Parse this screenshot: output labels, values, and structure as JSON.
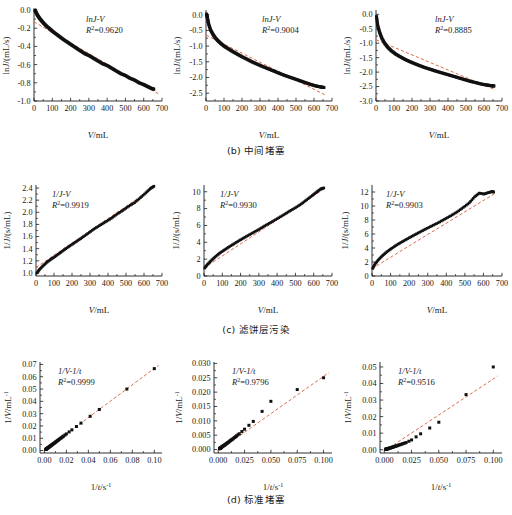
{
  "figure": {
    "panel_rows": [
      {
        "caption": "(b) 中间堵塞",
        "panels": [
          {
            "annotation_model": "lnJ-V",
            "annotation_r2_label": "R",
            "annotation_r2_value": "=0.9620",
            "xlabel": "V/mL",
            "ylabel": "lnJ/(mL/s)"
          },
          {
            "annotation_model": "lnJ-V",
            "annotation_r2_label": "R",
            "annotation_r2_value": "=0.9004",
            "xlabel": "V/mL",
            "ylabel": "lnJ/(mL/s)"
          },
          {
            "annotation_model": "lnJ-V",
            "annotation_r2_label": "R",
            "annotation_r2_value": "=0.8885",
            "xlabel": "V/mL",
            "ylabel": "lnJ/(mL/s)"
          }
        ]
      },
      {
        "caption": "(c) 滤饼层污染",
        "panels": [
          {
            "annotation_model": "1/J-V",
            "annotation_r2_label": "R",
            "annotation_r2_value": "=0.9919",
            "xlabel": "V/mL",
            "ylabel": "1/J/(s/mL)"
          },
          {
            "annotation_model": "1/J-V",
            "annotation_r2_label": "R",
            "annotation_r2_value": "=0.9930",
            "xlabel": "V/mL",
            "ylabel": "1/J/(s/mL)"
          },
          {
            "annotation_model": "1/J-V",
            "annotation_r2_label": "R",
            "annotation_r2_value": "=0.9903",
            "xlabel": "V/mL",
            "ylabel": "1/J/(s/mL)"
          }
        ]
      },
      {
        "caption": "(d) 标准堵塞",
        "panels": [
          {
            "annotation_model": "1/V-1/t",
            "annotation_r2_label": "R",
            "annotation_r2_value": "=0.9999",
            "xlabel": "1/t/s",
            "xlabel_sup": "-1",
            "ylabel": "1/V/mL",
            "ylabel_sup": "-1"
          },
          {
            "annotation_model": "1/V-1/t",
            "annotation_r2_label": "R",
            "annotation_r2_value": "=0.9796",
            "xlabel": "1/t/s",
            "xlabel_sup": "-1",
            "ylabel": "1/V/mL",
            "ylabel_sup": "-1"
          },
          {
            "annotation_model": "1/V-1/t",
            "annotation_r2_label": "R",
            "annotation_r2_value": "=0.9516",
            "xlabel": "1/t/s",
            "xlabel_sup": "-1",
            "ylabel": "1/V/mL",
            "ylabel_sup": "-1"
          }
        ]
      }
    ],
    "colors": {
      "marker": "#111111",
      "fit_line": "#E06A4E",
      "axis": "#1a1a1a"
    }
  },
  "chart_data": [
    {
      "id": "b1",
      "type": "scatter",
      "title": "lnJ-V",
      "r2": 0.962,
      "xlabel": "V/mL",
      "ylabel": "lnJ/(mL/s)",
      "xlim": [
        0,
        700
      ],
      "ylim": [
        -1.0,
        0.0
      ],
      "xticks": [
        0,
        100,
        200,
        300,
        400,
        500,
        600,
        700
      ],
      "yticks": [
        0.0,
        -0.2,
        -0.4,
        -0.6,
        -0.8,
        -1.0
      ],
      "grid": false,
      "legend": "none",
      "x": [
        5,
        12,
        20,
        30,
        42,
        55,
        70,
        88,
        105,
        125,
        145,
        165,
        188,
        210,
        232,
        255,
        278,
        300,
        325,
        350,
        375,
        400,
        425,
        450,
        475,
        500,
        525,
        550,
        575,
        600,
        620,
        640,
        655
      ],
      "y": [
        0.0,
        -0.03,
        -0.06,
        -0.09,
        -0.12,
        -0.15,
        -0.18,
        -0.21,
        -0.24,
        -0.27,
        -0.3,
        -0.33,
        -0.36,
        -0.39,
        -0.42,
        -0.45,
        -0.48,
        -0.5,
        -0.53,
        -0.56,
        -0.59,
        -0.61,
        -0.64,
        -0.67,
        -0.7,
        -0.72,
        -0.75,
        -0.77,
        -0.8,
        -0.82,
        -0.84,
        -0.86,
        -0.87
      ],
      "fit": {
        "type": "linear",
        "x": [
          0,
          680
        ],
        "y": [
          -0.13,
          -0.92
        ]
      }
    },
    {
      "id": "b2",
      "type": "scatter",
      "title": "lnJ-V",
      "r2": 0.9004,
      "xlabel": "V/mL",
      "ylabel": "lnJ/(mL/s)",
      "xlim": [
        0,
        700
      ],
      "ylim": [
        -2.75,
        0.15
      ],
      "xticks": [
        0,
        100,
        200,
        300,
        400,
        500,
        600,
        700
      ],
      "yticks": [
        0.0,
        -0.5,
        -1.0,
        -1.5,
        -2.0,
        -2.5
      ],
      "grid": false,
      "legend": "none",
      "x": [
        3,
        8,
        15,
        25,
        38,
        52,
        68,
        85,
        105,
        128,
        150,
        175,
        200,
        228,
        255,
        282,
        310,
        340,
        370,
        400,
        430,
        460,
        490,
        520,
        550,
        580,
        610,
        635,
        655
      ],
      "y": [
        0.02,
        -0.1,
        -0.3,
        -0.48,
        -0.62,
        -0.74,
        -0.84,
        -0.93,
        -1.02,
        -1.1,
        -1.18,
        -1.26,
        -1.34,
        -1.42,
        -1.5,
        -1.57,
        -1.64,
        -1.71,
        -1.78,
        -1.85,
        -1.92,
        -1.98,
        -2.04,
        -2.1,
        -2.16,
        -2.22,
        -2.27,
        -2.3,
        -2.32
      ],
      "fit": {
        "type": "linear",
        "x": [
          0,
          660
        ],
        "y": [
          -0.65,
          -2.55
        ]
      }
    },
    {
      "id": "b3",
      "type": "scatter",
      "title": "lnJ-V",
      "r2": 0.8885,
      "xlabel": "V/mL",
      "ylabel": "lnJ/(mL/s)",
      "xlim": [
        0,
        700
      ],
      "ylim": [
        -3.0,
        0.15
      ],
      "xticks": [
        0,
        100,
        200,
        300,
        400,
        500,
        600,
        700
      ],
      "yticks": [
        0.0,
        -0.5,
        -1.0,
        -1.5,
        -2.0,
        -2.5,
        -3.0
      ],
      "grid": false,
      "legend": "none",
      "x": [
        3,
        10,
        20,
        32,
        48,
        65,
        85,
        108,
        132,
        158,
        185,
        212,
        240,
        270,
        300,
        330,
        362,
        395,
        428,
        460,
        492,
        525,
        558,
        590,
        618,
        640,
        655
      ],
      "y": [
        -0.08,
        -0.4,
        -0.62,
        -0.82,
        -1.0,
        -1.14,
        -1.26,
        -1.37,
        -1.46,
        -1.55,
        -1.63,
        -1.7,
        -1.77,
        -1.84,
        -1.9,
        -1.96,
        -2.02,
        -2.08,
        -2.14,
        -2.2,
        -2.26,
        -2.32,
        -2.37,
        -2.42,
        -2.45,
        -2.47,
        -2.48
      ],
      "fit": {
        "type": "linear",
        "x": [
          0,
          665
        ],
        "y": [
          -0.88,
          -2.62
        ]
      }
    },
    {
      "id": "c1",
      "type": "scatter",
      "title": "1/J-V",
      "r2": 0.9919,
      "xlabel": "V/mL",
      "ylabel": "1/J/(s/mL)",
      "xlim": [
        0,
        700
      ],
      "ylim": [
        0.95,
        2.45
      ],
      "xticks": [
        0,
        100,
        200,
        300,
        400,
        500,
        600,
        700
      ],
      "yticks": [
        1.0,
        1.2,
        1.4,
        1.6,
        1.8,
        2.0,
        2.2,
        2.4
      ],
      "grid": false,
      "legend": "none",
      "x": [
        5,
        20,
        40,
        62,
        85,
        110,
        138,
        165,
        195,
        225,
        255,
        288,
        320,
        352,
        385,
        418,
        450,
        482,
        515,
        548,
        580,
        610,
        635,
        655
      ],
      "y": [
        1.0,
        1.06,
        1.12,
        1.18,
        1.23,
        1.28,
        1.34,
        1.4,
        1.46,
        1.52,
        1.58,
        1.65,
        1.72,
        1.78,
        1.84,
        1.9,
        1.97,
        2.03,
        2.1,
        2.16,
        2.24,
        2.32,
        2.39,
        2.43
      ],
      "fit": {
        "type": "linear",
        "x": [
          0,
          665
        ],
        "y": [
          1.09,
          2.43
        ]
      }
    },
    {
      "id": "c2",
      "type": "scatter",
      "title": "1/J-V",
      "r2": 0.993,
      "xlabel": "V/mL",
      "ylabel": "1/J/(s/mL)",
      "xlim": [
        0,
        700
      ],
      "ylim": [
        0,
        10.8
      ],
      "xticks": [
        0,
        100,
        200,
        300,
        400,
        500,
        600,
        700
      ],
      "yticks": [
        0,
        2,
        4,
        6,
        8,
        10
      ],
      "grid": false,
      "legend": "none",
      "x": [
        4,
        18,
        38,
        60,
        85,
        112,
        140,
        170,
        200,
        232,
        265,
        298,
        332,
        365,
        400,
        435,
        468,
        500,
        532,
        562,
        592,
        618,
        640,
        655
      ],
      "y": [
        0.95,
        1.35,
        1.8,
        2.25,
        2.7,
        3.1,
        3.5,
        3.9,
        4.3,
        4.7,
        5.1,
        5.5,
        5.95,
        6.35,
        6.8,
        7.25,
        7.7,
        8.1,
        8.55,
        9.05,
        9.55,
        10.0,
        10.35,
        10.45
      ],
      "fit": {
        "type": "linear",
        "x": [
          0,
          665
        ],
        "y": [
          0.95,
          10.45
        ]
      }
    },
    {
      "id": "c3",
      "type": "scatter",
      "title": "1/J-V",
      "r2": 0.9903,
      "xlabel": "V/mL",
      "ylabel": "1/J/(s/mL)",
      "xlim": [
        0,
        700
      ],
      "ylim": [
        0,
        13.0
      ],
      "xticks": [
        0,
        100,
        200,
        300,
        400,
        500,
        600,
        700
      ],
      "yticks": [
        0,
        2,
        4,
        6,
        8,
        10,
        12
      ],
      "grid": false,
      "legend": "none",
      "x": [
        4,
        16,
        34,
        56,
        80,
        106,
        134,
        163,
        193,
        224,
        256,
        288,
        322,
        356,
        390,
        424,
        458,
        492,
        524,
        552,
        578,
        602,
        625,
        645,
        655
      ],
      "y": [
        1.1,
        1.7,
        2.3,
        2.9,
        3.45,
        3.95,
        4.45,
        4.9,
        5.35,
        5.8,
        6.25,
        6.7,
        7.15,
        7.6,
        8.1,
        8.6,
        9.15,
        9.8,
        10.45,
        11.3,
        11.85,
        11.7,
        11.9,
        12.05,
        12.0
      ],
      "fit": {
        "type": "linear",
        "x": [
          0,
          665
        ],
        "y": [
          1.05,
          11.85
        ]
      }
    },
    {
      "id": "d1",
      "type": "scatter",
      "title": "1/V-1/t",
      "r2": 0.9999,
      "xlabel": "1/t/s^-1",
      "ylabel": "1/V/mL^-1",
      "xlim": [
        -0.004,
        0.107
      ],
      "ylim": [
        -0.002,
        0.072
      ],
      "xticks": [
        0.0,
        0.02,
        0.04,
        0.06,
        0.08,
        0.1
      ],
      "yticks": [
        0.0,
        0.01,
        0.02,
        0.03,
        0.04,
        0.05,
        0.06,
        0.07
      ],
      "grid": false,
      "legend": "none",
      "x": [
        0.0012,
        0.0016,
        0.002,
        0.0025,
        0.003,
        0.0036,
        0.0043,
        0.005,
        0.0058,
        0.0066,
        0.0075,
        0.0085,
        0.0095,
        0.0105,
        0.0118,
        0.013,
        0.0145,
        0.016,
        0.0175,
        0.02,
        0.025,
        0.0333,
        0.05,
        0.1
      ],
      "y": [
        0.0008,
        0.0011,
        0.0014,
        0.0017,
        0.0021,
        0.0025,
        0.0029,
        0.0034,
        0.0039,
        0.0045,
        0.0051,
        0.0057,
        0.0064,
        0.0071,
        0.008,
        0.0088,
        0.0098,
        0.0108,
        0.0118,
        0.0135,
        0.0168,
        0.0223,
        0.0334,
        0.0666
      ],
      "fit": {
        "type": "linear",
        "x": [
          0.0,
          0.104
        ],
        "y": [
          0.0002,
          0.0694
        ]
      }
    },
    {
      "id": "d2",
      "type": "scatter",
      "title": "1/V-1/t",
      "r2": 0.9796,
      "xlabel": "1/t/s^-1",
      "ylabel": "1/V/mL^-1",
      "xlim": [
        -0.004,
        0.108
      ],
      "ylim": [
        -0.0012,
        0.0305
      ],
      "xticks": [
        0.0,
        0.025,
        0.05,
        0.075,
        0.1
      ],
      "yticks": [
        0.0,
        0.005,
        0.01,
        0.015,
        0.02,
        0.025,
        0.03
      ],
      "grid": false,
      "legend": "none",
      "x": [
        0.0012,
        0.0016,
        0.002,
        0.0025,
        0.003,
        0.0037,
        0.0045,
        0.0053,
        0.0062,
        0.0072,
        0.0083,
        0.0095,
        0.0108,
        0.0122,
        0.0138,
        0.0155,
        0.0175,
        0.02,
        0.025,
        0.0333,
        0.05,
        0.1
      ],
      "y": [
        0.0003,
        0.0004,
        0.0005,
        0.0006,
        0.0008,
        0.001,
        0.0012,
        0.0014,
        0.0016,
        0.0019,
        0.0022,
        0.0025,
        0.0029,
        0.0033,
        0.0037,
        0.0042,
        0.0048,
        0.0055,
        0.0071,
        0.0098,
        0.0168,
        0.025
      ],
      "fit": {
        "type": "linear",
        "x": [
          0.0,
          0.105
        ],
        "y": [
          -0.0005,
          0.0268
        ]
      }
    },
    {
      "id": "d3",
      "type": "scatter",
      "title": "1/V-1/t",
      "r2": 0.9516,
      "xlabel": "1/t/s^-1",
      "ylabel": "1/V/mL^-1",
      "xlim": [
        -0.004,
        0.108
      ],
      "ylim": [
        -0.002,
        0.053
      ],
      "xticks": [
        0.0,
        0.025,
        0.05,
        0.075,
        0.1
      ],
      "yticks": [
        0.0,
        0.01,
        0.02,
        0.03,
        0.04,
        0.05
      ],
      "grid": false,
      "legend": "none",
      "x": [
        0.0012,
        0.0016,
        0.0021,
        0.0026,
        0.0032,
        0.0039,
        0.0047,
        0.0056,
        0.0066,
        0.0077,
        0.0089,
        0.0102,
        0.0117,
        0.0133,
        0.0152,
        0.0173,
        0.02,
        0.025,
        0.0333,
        0.05,
        0.1
      ],
      "y": [
        0.0002,
        0.0003,
        0.0004,
        0.0005,
        0.0006,
        0.0008,
        0.0009,
        0.0011,
        0.0013,
        0.0016,
        0.0018,
        0.0021,
        0.0024,
        0.0028,
        0.0032,
        0.0037,
        0.0043,
        0.0059,
        0.0096,
        0.0166,
        0.05
      ],
      "fit": {
        "type": "linear",
        "x": [
          0.0,
          0.104
        ],
        "y": [
          -0.0008,
          0.0445
        ]
      }
    }
  ]
}
